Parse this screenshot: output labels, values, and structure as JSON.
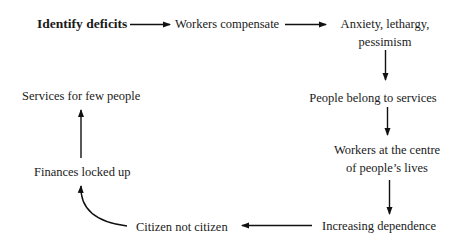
{
  "diagram": {
    "type": "flow-cycle",
    "nodes": [
      {
        "id": "identify-deficits",
        "label": "Identify deficits",
        "emphasis": "bold"
      },
      {
        "id": "workers-compensate",
        "label": "Workers compensate"
      },
      {
        "id": "anxiety",
        "lines": [
          "Anxiety, lethargy,",
          "pessimism"
        ]
      },
      {
        "id": "people-belong",
        "label": "People belong to services"
      },
      {
        "id": "workers-centre",
        "lines": [
          "Workers at the centre",
          "of people’s lives"
        ]
      },
      {
        "id": "increasing-dependence",
        "label": "Increasing dependence"
      },
      {
        "id": "citizen-not-citizen",
        "label": "Citizen not citizen"
      },
      {
        "id": "finances-locked",
        "label": "Finances locked up"
      },
      {
        "id": "services-few",
        "label": "Services for few people"
      }
    ],
    "edges": [
      {
        "from": "identify-deficits",
        "to": "workers-compensate"
      },
      {
        "from": "workers-compensate",
        "to": "anxiety"
      },
      {
        "from": "anxiety",
        "to": "people-belong"
      },
      {
        "from": "people-belong",
        "to": "workers-centre"
      },
      {
        "from": "workers-centre",
        "to": "increasing-dependence"
      },
      {
        "from": "increasing-dependence",
        "to": "citizen-not-citizen"
      },
      {
        "from": "citizen-not-citizen",
        "to": "finances-locked",
        "style": "curved"
      },
      {
        "from": "finances-locked",
        "to": "services-few"
      }
    ],
    "colors": {
      "text": "#1a1a1a",
      "arrow": "#111111",
      "background": "#ffffff"
    }
  }
}
